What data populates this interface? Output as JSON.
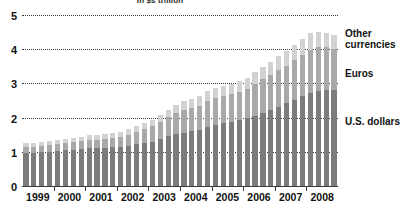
{
  "chart_data": {
    "type": "bar",
    "stacked": true,
    "title": "In $s trillion",
    "xlabel": "",
    "ylabel": "",
    "ylim": [
      0,
      5
    ],
    "yticks": [
      0,
      1,
      2,
      3,
      4,
      5
    ],
    "grid": true,
    "legend_position": "right",
    "categories": [
      "1999 Q1",
      "1999 Q2",
      "1999 Q3",
      "1999 Q4",
      "2000 Q1",
      "2000 Q2",
      "2000 Q3",
      "2000 Q4",
      "2001 Q1",
      "2001 Q2",
      "2001 Q3",
      "2001 Q4",
      "2002 Q1",
      "2002 Q2",
      "2002 Q3",
      "2002 Q4",
      "2003 Q1",
      "2003 Q2",
      "2003 Q3",
      "2003 Q4",
      "2004 Q1",
      "2004 Q2",
      "2004 Q3",
      "2004 Q4",
      "2005 Q1",
      "2005 Q2",
      "2005 Q3",
      "2005 Q4",
      "2006 Q1",
      "2006 Q2",
      "2006 Q3",
      "2006 Q4",
      "2007 Q1",
      "2007 Q2",
      "2007 Q3",
      "2007 Q4",
      "2008 Q1",
      "2008 Q2",
      "2008 Q3",
      "2008 Q4"
    ],
    "year_labels": [
      "1999",
      "2000",
      "2001",
      "2002",
      "2003",
      "2004",
      "2005",
      "2006",
      "2007",
      "2008"
    ],
    "series": [
      {
        "name": "U.S. dollars",
        "color": "#7c7c7c",
        "values": [
          0.96,
          0.97,
          0.98,
          1.0,
          1.02,
          1.05,
          1.06,
          1.08,
          1.1,
          1.11,
          1.12,
          1.13,
          1.15,
          1.18,
          1.22,
          1.26,
          1.3,
          1.38,
          1.45,
          1.52,
          1.56,
          1.6,
          1.64,
          1.72,
          1.78,
          1.84,
          1.88,
          1.94,
          1.98,
          2.06,
          2.14,
          2.22,
          2.32,
          2.42,
          2.52,
          2.62,
          2.72,
          2.78,
          2.8,
          2.8
        ]
      },
      {
        "name": "Euros",
        "color": "#a9a9a9",
        "values": [
          0.18,
          0.18,
          0.19,
          0.2,
          0.21,
          0.21,
          0.22,
          0.23,
          0.24,
          0.25,
          0.26,
          0.27,
          0.29,
          0.32,
          0.36,
          0.4,
          0.45,
          0.5,
          0.56,
          0.62,
          0.66,
          0.68,
          0.7,
          0.76,
          0.78,
          0.78,
          0.8,
          0.82,
          0.86,
          0.92,
          0.98,
          1.02,
          1.06,
          1.1,
          1.16,
          1.22,
          1.26,
          1.28,
          1.26,
          1.22
        ]
      },
      {
        "name": "Other currencies",
        "color": "#d2d2d2",
        "values": [
          0.11,
          0.11,
          0.11,
          0.12,
          0.12,
          0.12,
          0.13,
          0.13,
          0.14,
          0.14,
          0.14,
          0.15,
          0.15,
          0.16,
          0.17,
          0.18,
          0.19,
          0.2,
          0.22,
          0.24,
          0.26,
          0.27,
          0.28,
          0.3,
          0.3,
          0.3,
          0.31,
          0.32,
          0.33,
          0.35,
          0.37,
          0.39,
          0.41,
          0.43,
          0.45,
          0.47,
          0.49,
          0.44,
          0.42,
          0.4
        ]
      }
    ]
  },
  "legend": {
    "other": "Other currencies",
    "euros": "Euros",
    "usd": "U.S. dollars"
  }
}
